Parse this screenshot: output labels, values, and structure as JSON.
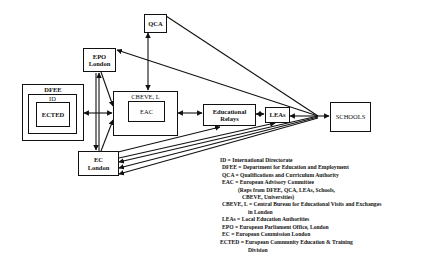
{
  "diagram": {
    "nodes": {
      "qca": "QCA",
      "epo": [
        "EPO",
        "London"
      ],
      "dfee": "DFEE",
      "id": "ID",
      "ected": "ECTED",
      "cbeve": "CBEVE, L",
      "eac": "EAC",
      "relays": [
        "Educational",
        "Relays"
      ],
      "leas": "LEAs",
      "schools": "SCHOOLS",
      "ec": [
        "EC",
        "London"
      ]
    },
    "edges": [
      {
        "from": "DFEE",
        "to": "CBEVE, L",
        "type": "bidirectional"
      },
      {
        "from": "QCA",
        "to": "CBEVE, L",
        "type": "bidirectional"
      },
      {
        "from": "CBEVE, L",
        "to": "Educational Relays",
        "type": "bidirectional"
      },
      {
        "from": "Educational Relays",
        "to": "LEAs",
        "type": "bidirectional"
      },
      {
        "from": "SCHOOLS hub",
        "to": "LEAs",
        "type": "directed"
      },
      {
        "from": "SCHOOLS hub",
        "to": "SCHOOLS",
        "type": "directed"
      },
      {
        "from": "QCA",
        "to": "SCHOOLS hub",
        "type": "line"
      },
      {
        "from": "SCHOOLS hub",
        "to": "EPO London",
        "type": "directed"
      },
      {
        "from": "EPO London",
        "to": "CBEVE, L",
        "type": "directed"
      },
      {
        "from": "EC London",
        "to": "EPO London",
        "type": "directed"
      },
      {
        "from": "EPO London",
        "to": "EC London",
        "type": "directed"
      },
      {
        "from": "EC London",
        "to": "CBEVE, L",
        "type": "directed"
      },
      {
        "from": "EC London",
        "to": "Educational Relays",
        "type": "directed"
      },
      {
        "from": "SCHOOLS hub",
        "to": "EC London",
        "type": "directed",
        "count": 3
      },
      {
        "from": "EC London",
        "to": "LEAs",
        "type": "directed"
      }
    ]
  },
  "legend": [
    {
      "abbr": "ID",
      "text": "ID = International Directorate"
    },
    {
      "abbr": "DFEE",
      "text": "DFEE = Department for Education and Employment"
    },
    {
      "abbr": "QCA",
      "text": "QCA = Qualifications and Curriculum Authority"
    },
    {
      "abbr": "EAC",
      "text": "EAC = European Advisory Committee"
    },
    {
      "abbr": "EAC-note1",
      "text": "(Reps from DFEE, QCA, LEAs, Schools,"
    },
    {
      "abbr": "EAC-note2",
      "text": "CBEVE, Universities)"
    },
    {
      "abbr": "CBEVE",
      "text": "CBEVE, L = Central Bureau for Educational Visits and Exchanges"
    },
    {
      "abbr": "CBEVE-cont",
      "text": "in London"
    },
    {
      "abbr": "LEAs",
      "text": "LEAs = Local Education Authorities"
    },
    {
      "abbr": "EPO",
      "text": "EPO = European Parliament Office, London"
    },
    {
      "abbr": "EC",
      "text": "EC = European Commission London"
    },
    {
      "abbr": "ECTED",
      "text": "ECTED = European Community Education & Training"
    },
    {
      "abbr": "ECTED-cont",
      "text": "Division"
    }
  ]
}
